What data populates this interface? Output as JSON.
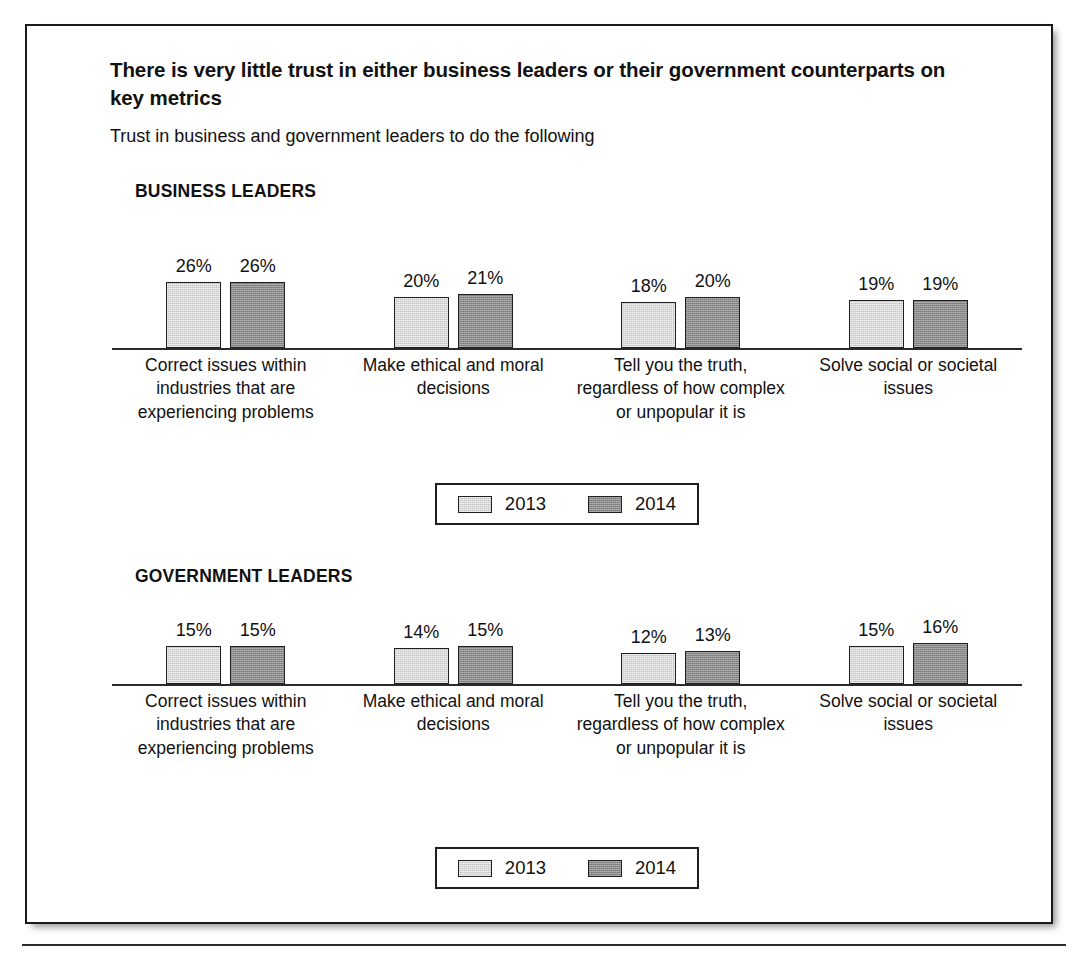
{
  "header": {
    "title": "There is very little trust in either business leaders or their government counterparts on key metrics",
    "subtitle": "Trust in business and government leaders to do the following"
  },
  "legend": {
    "entries": [
      {
        "label": "2013",
        "swatch": "light-gray-swatch"
      },
      {
        "label": "2014",
        "swatch": "dark-gray-swatch"
      }
    ]
  },
  "colors": {
    "series_2013": "#c3c3c3",
    "series_2014": "#8b8b8b",
    "outline": "#1f1f1f",
    "axis": "#2b2b2b",
    "text": "#111111"
  },
  "sections": [
    {
      "heading": "BUSINESS LEADERS"
    },
    {
      "heading": "GOVERNMENT LEADERS"
    }
  ],
  "chart_data": [
    {
      "type": "bar",
      "title": "BUSINESS LEADERS",
      "categories": [
        "Correct issues within industries that are experiencing problems",
        "Make ethical and moral decisions",
        "Tell you the truth, regardless of how complex or unpopular it is",
        "Solve social or societal issues"
      ],
      "series": [
        {
          "name": "2013",
          "values": [
            26,
            20,
            18,
            19
          ],
          "labels": [
            "26%",
            "20%",
            "18%",
            "19%"
          ]
        },
        {
          "name": "2014",
          "values": [
            26,
            21,
            20,
            19
          ],
          "labels": [
            "26%",
            "21%",
            "20%",
            "19%"
          ]
        }
      ],
      "xlabel": "",
      "ylabel": "",
      "ylim": [
        0,
        30
      ],
      "grid": false,
      "legend_position": "bottom",
      "units": "percent"
    },
    {
      "type": "bar",
      "title": "GOVERNMENT LEADERS",
      "categories": [
        "Correct issues within industries that are experiencing problems",
        "Make ethical and moral decisions",
        "Tell you the truth, regardless of how complex or unpopular it is",
        "Solve social or societal issues"
      ],
      "series": [
        {
          "name": "2013",
          "values": [
            15,
            14,
            12,
            15
          ],
          "labels": [
            "15%",
            "14%",
            "12%",
            "15%"
          ]
        },
        {
          "name": "2014",
          "values": [
            15,
            15,
            13,
            16
          ],
          "labels": [
            "15%",
            "15%",
            "13%",
            "16%"
          ]
        }
      ],
      "xlabel": "",
      "ylabel": "",
      "ylim": [
        0,
        30
      ],
      "grid": false,
      "legend_position": "bottom",
      "units": "percent"
    }
  ]
}
